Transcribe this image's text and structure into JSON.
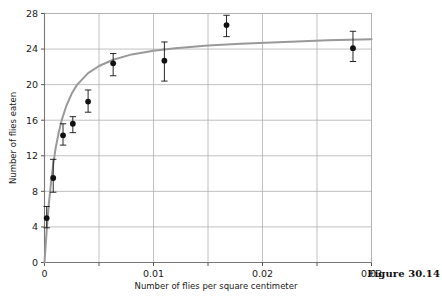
{
  "figure": {
    "caption": "Figure 30.14"
  },
  "chart_data": {
    "type": "scatter",
    "title": "",
    "xlabel": "Number of flies per square centimeter",
    "ylabel": "Number of flies eaten",
    "xlim": [
      0,
      0.03
    ],
    "ylim": [
      0,
      28
    ],
    "grid": true,
    "legend": false,
    "xticks": [
      0,
      0.005,
      0.01,
      0.015,
      0.02,
      0.025,
      0.03
    ],
    "xticklabels": [
      "0",
      "",
      "0.01",
      "",
      "0.02",
      "",
      "0.03"
    ],
    "yticks": [
      0,
      4,
      8,
      12,
      16,
      20,
      24,
      28
    ],
    "yticklabels": [
      "0",
      "4",
      "8",
      "12",
      "16",
      "20",
      "24",
      "28"
    ],
    "marker_color": "#111111",
    "errorbar_color": "#111111",
    "curve_color": "#999999",
    "grid_color": "#b0b0b0",
    "axis_color": "#808080",
    "points": [
      {
        "x": 0.0002,
        "y": 5.0,
        "yerr_low": 3.9,
        "yerr_high": 6.3
      },
      {
        "x": 0.0008,
        "y": 9.5,
        "yerr_low": 7.9,
        "yerr_high": 11.6
      },
      {
        "x": 0.0017,
        "y": 14.3,
        "yerr_low": 13.2,
        "yerr_high": 15.6
      },
      {
        "x": 0.0026,
        "y": 15.6,
        "yerr_low": 14.6,
        "yerr_high": 16.4
      },
      {
        "x": 0.004,
        "y": 18.1,
        "yerr_low": 16.9,
        "yerr_high": 19.4
      },
      {
        "x": 0.0063,
        "y": 22.4,
        "yerr_low": 21.0,
        "yerr_high": 23.5
      },
      {
        "x": 0.011,
        "y": 22.7,
        "yerr_low": 20.4,
        "yerr_high": 24.8
      },
      {
        "x": 0.0167,
        "y": 26.7,
        "yerr_low": 25.4,
        "yerr_high": 27.8
      },
      {
        "x": 0.0283,
        "y": 24.1,
        "yerr_low": 22.6,
        "yerr_high": 26.0
      }
    ],
    "curve": {
      "model": "saturating",
      "description": "Fitted saturating (Holling type II) curve through the points",
      "points": [
        {
          "x": 0.0,
          "y": 0.0
        },
        {
          "x": 0.0002,
          "y": 3.6
        },
        {
          "x": 0.0004,
          "y": 6.6
        },
        {
          "x": 0.0006,
          "y": 9.0
        },
        {
          "x": 0.0008,
          "y": 11.0
        },
        {
          "x": 0.001,
          "y": 12.7
        },
        {
          "x": 0.0013,
          "y": 14.6
        },
        {
          "x": 0.0016,
          "y": 16.1
        },
        {
          "x": 0.002,
          "y": 17.6
        },
        {
          "x": 0.0025,
          "y": 19.0
        },
        {
          "x": 0.003,
          "y": 20.0
        },
        {
          "x": 0.004,
          "y": 21.3
        },
        {
          "x": 0.005,
          "y": 22.1
        },
        {
          "x": 0.0063,
          "y": 22.8
        },
        {
          "x": 0.008,
          "y": 23.4
        },
        {
          "x": 0.01,
          "y": 23.8
        },
        {
          "x": 0.012,
          "y": 24.1
        },
        {
          "x": 0.015,
          "y": 24.4
        },
        {
          "x": 0.018,
          "y": 24.6
        },
        {
          "x": 0.022,
          "y": 24.8
        },
        {
          "x": 0.026,
          "y": 25.0
        },
        {
          "x": 0.03,
          "y": 25.1
        }
      ]
    }
  }
}
